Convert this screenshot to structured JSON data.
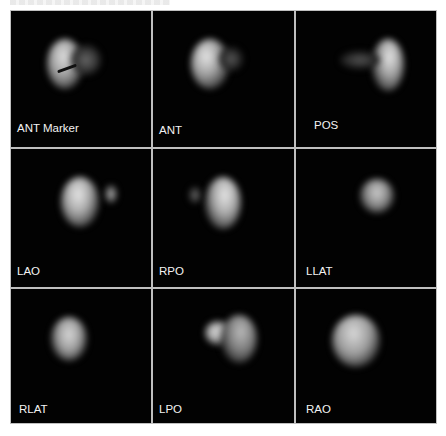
{
  "figure": {
    "layout": "3x3 grid of scintigraphy views",
    "background_color": "#020202",
    "grid_line_color": "#bfbfbf",
    "label_color": "#f2f2f2",
    "panels": [
      {
        "label": "ANT Marker",
        "row": 0,
        "col": 0,
        "has_marker": true
      },
      {
        "label": "ANT",
        "row": 0,
        "col": 1
      },
      {
        "label": "POS",
        "row": 0,
        "col": 2
      },
      {
        "label": "LAO",
        "row": 1,
        "col": 0
      },
      {
        "label": "RPO",
        "row": 1,
        "col": 1
      },
      {
        "label": "LLAT",
        "row": 1,
        "col": 2
      },
      {
        "label": "RLAT",
        "row": 2,
        "col": 0
      },
      {
        "label": "LPO",
        "row": 2,
        "col": 1
      },
      {
        "label": "RAO",
        "row": 2,
        "col": 2
      }
    ]
  }
}
